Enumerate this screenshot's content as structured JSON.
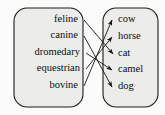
{
  "diagram": {
    "colors": {
      "box_fill": "#ececeb",
      "box_stroke": "#1c1c1c",
      "arrow": "#141414",
      "text": "#0d0d0d",
      "background": "#fbfbfb"
    },
    "left_group": {
      "name": "adjective-group",
      "items": [
        {
          "id": "feline",
          "label": "feline",
          "x": 78,
          "y": 20
        },
        {
          "id": "canine",
          "label": "canine",
          "x": 78,
          "y": 36
        },
        {
          "id": "dromedary",
          "label": "dromedary",
          "x": 78,
          "y": 53
        },
        {
          "id": "equestrian",
          "label": "equestrian",
          "x": 78,
          "y": 69
        },
        {
          "id": "bovine",
          "label": "bovine",
          "x": 78,
          "y": 86
        }
      ]
    },
    "right_group": {
      "name": "animal-group",
      "items": [
        {
          "id": "cow",
          "label": "cow",
          "x": 118,
          "y": 20
        },
        {
          "id": "horse",
          "label": "horse",
          "x": 118,
          "y": 37
        },
        {
          "id": "cat",
          "label": "cat",
          "x": 118,
          "y": 54
        },
        {
          "id": "camel",
          "label": "camel",
          "x": 118,
          "y": 70
        },
        {
          "id": "dog",
          "label": "dog",
          "x": 118,
          "y": 87
        }
      ]
    },
    "links": [
      {
        "from": "feline",
        "to": "cat",
        "x1": 84,
        "y1": 20,
        "x2": 113,
        "y2": 54
      },
      {
        "from": "canine",
        "to": "dog",
        "x1": 84,
        "y1": 36,
        "x2": 112,
        "y2": 87
      },
      {
        "from": "dromedary",
        "to": "camel",
        "x1": 86,
        "y1": 53,
        "x2": 112,
        "y2": 70
      },
      {
        "from": "equestrian",
        "to": "horse",
        "x1": 86,
        "y1": 69,
        "x2": 112,
        "y2": 37
      },
      {
        "from": "bovine",
        "to": "cow",
        "x1": 84,
        "y1": 86,
        "x2": 112,
        "y2": 20
      }
    ]
  }
}
